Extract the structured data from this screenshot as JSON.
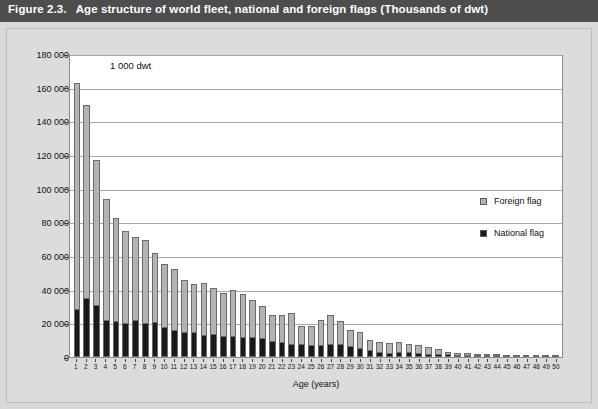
{
  "figure": {
    "number": "Figure 2.3.",
    "title": "Age structure of world fleet, national and foreign flags (Thousands of dwt)"
  },
  "chart_data": {
    "type": "bar",
    "subtype": "stacked-column",
    "title": "Age structure of world fleet, national and foreign flags (Thousands of dwt)",
    "unit_label": "1 000 dwt",
    "xlabel": "Age (years)",
    "ylabel": "",
    "ylim": [
      0,
      180000
    ],
    "ytick_step": 20000,
    "grid": true,
    "legend_position": "inside-right",
    "categories": [
      "1",
      "2",
      "3",
      "4",
      "5",
      "6",
      "7",
      "8",
      "9",
      "10",
      "11",
      "12",
      "13",
      "14",
      "15",
      "16",
      "17",
      "18",
      "19",
      "20",
      "21",
      "22",
      "23",
      "24",
      "25",
      "26",
      "27",
      "28",
      "29",
      "30",
      "31",
      "32",
      "33",
      "34",
      "35",
      "36",
      "37",
      "38",
      "39",
      "40",
      "41",
      "42",
      "43",
      "44",
      "45",
      "46",
      "47",
      "48",
      "49",
      "50"
    ],
    "ytick_labels": [
      "0",
      "20 000",
      "40 000",
      "60 000",
      "80 000",
      "100 000",
      "120 000",
      "140 000",
      "160 000",
      "180 000"
    ],
    "ytick_values": [
      0,
      20000,
      40000,
      60000,
      80000,
      100000,
      120000,
      140000,
      160000,
      180000
    ],
    "series": [
      {
        "name": "National flag",
        "color": "#1a1a1a",
        "values": [
          28000,
          34500,
          30500,
          21500,
          21000,
          19800,
          21500,
          20000,
          20300,
          17500,
          15700,
          14800,
          14900,
          13000,
          13300,
          12500,
          12000,
          11400,
          11500,
          11200,
          9400,
          8500,
          7600,
          7300,
          7000,
          7200,
          7600,
          7400,
          6400,
          5400,
          4300,
          3000,
          2300,
          2600,
          2400,
          2200,
          1700,
          1400,
          1200,
          1000,
          800,
          750,
          700,
          650,
          600,
          550,
          500,
          450,
          400,
          400
        ]
      },
      {
        "name": "Foreign flag",
        "color": "#b3b3b3",
        "values": [
          135000,
          115000,
          86500,
          72500,
          61500,
          55200,
          50000,
          49500,
          41200,
          37500,
          36300,
          30700,
          28400,
          31000,
          27700,
          25400,
          28000,
          26100,
          22500,
          19000,
          15400,
          16500,
          18700,
          11400,
          11700,
          14800,
          17200,
          14200,
          9900,
          9200,
          6000,
          5800,
          5900,
          6300,
          5400,
          5000,
          4300,
          3200,
          2000,
          1600,
          1300,
          1100,
          1000,
          900,
          800,
          700,
          600,
          550,
          500,
          500
        ]
      }
    ],
    "totals": [
      163000,
      149500,
      117000,
      94000,
      82500,
      75000,
      71500,
      69500,
      61500,
      55000,
      52000,
      45500,
      43300,
      44000,
      41000,
      37900,
      40000,
      37500,
      34000,
      30200,
      24800,
      25000,
      26300,
      18700,
      18700,
      22000,
      24800,
      21600,
      16300,
      14600,
      10300,
      8800,
      8200,
      8900,
      7800,
      7200,
      6000,
      4600,
      3200,
      2600,
      2100,
      1850,
      1700,
      1550,
      1400,
      1250,
      1100,
      1000,
      900,
      900
    ]
  },
  "legend": {
    "items": [
      {
        "label": "Foreign flag",
        "color": "#b3b3b3"
      },
      {
        "label": "National flag",
        "color": "#1a1a1a"
      }
    ]
  }
}
